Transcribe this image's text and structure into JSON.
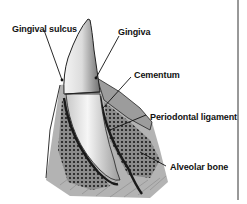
{
  "diagram": {
    "labels": [
      {
        "id": "gingival-sulcus",
        "text": "Gingival sulcus"
      },
      {
        "id": "gingiva",
        "text": "Gingiva"
      },
      {
        "id": "cementum",
        "text": "Cementum"
      },
      {
        "id": "periodontal-ligament",
        "text": "Periodontal ligament"
      },
      {
        "id": "alveolar-bone",
        "text": "Alveolar bone"
      }
    ],
    "colors": {
      "background": "#ffffff",
      "ink": "#111111",
      "enamel": "#e8e8e8",
      "bone_shade": "#9a9a9a",
      "gum_shade": "#b8b8b8"
    }
  }
}
